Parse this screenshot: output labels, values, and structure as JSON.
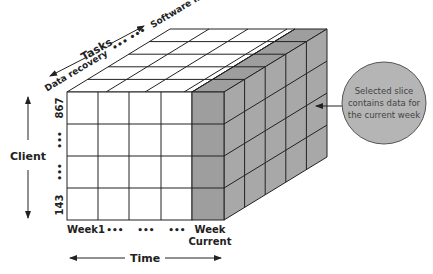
{
  "colors": {
    "background": "#ffffff",
    "cell_fill": "#ffffff",
    "slice_fill": "#9e9e9e",
    "slice_side_fill": "#a8a8a8",
    "line": "#222222",
    "callout_fill": "#b5b5b5",
    "callout_border": "#555555",
    "text": "#222222"
  },
  "axes": {
    "tasks": {
      "title": "Tasks",
      "start_label": "Data recovery",
      "ellipsis": "••• •••",
      "end_label": "Software minor"
    },
    "client": {
      "title": "Client",
      "top_label": "867",
      "mid_label_1": "•••",
      "mid_label_2": "•••",
      "bottom_label": "143"
    },
    "time": {
      "title": "Time",
      "labels": [
        "Week1",
        "•••",
        "•••",
        "•••"
      ],
      "current_label_line1": "Week",
      "current_label_line2": "Current"
    }
  },
  "cube": {
    "columns": 5,
    "rows": 4,
    "depth": 5,
    "highlighted_column": "Week Current"
  },
  "callout": {
    "line1": "Selected slice",
    "line2": "contains data for",
    "line3": "the current week"
  }
}
